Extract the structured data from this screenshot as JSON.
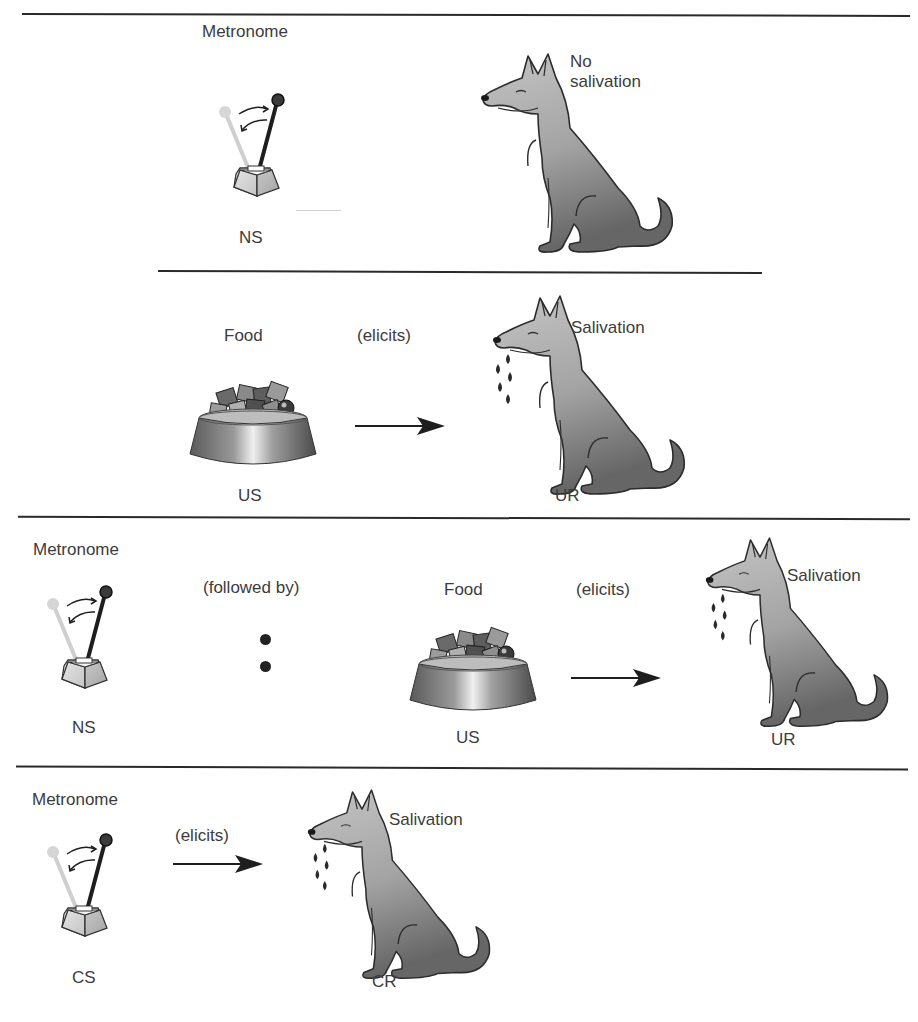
{
  "diagram": {
    "panels": [
      {
        "id": "before-conditioning-ns",
        "stimulus": {
          "name": "Metronome",
          "code": "NS"
        },
        "response": {
          "name": "No salivation"
        },
        "response_lines": [
          "No",
          "salivation"
        ]
      },
      {
        "id": "before-conditioning-us",
        "stimulus": {
          "name": "Food",
          "code": "US"
        },
        "relation": "(elicits)",
        "response": {
          "name": "Salivation",
          "code": "UR"
        }
      },
      {
        "id": "during-conditioning",
        "stimulus": {
          "name": "Metronome",
          "code": "NS"
        },
        "relation_1": "(followed by)",
        "stimulus_2": {
          "name": "Food",
          "code": "US"
        },
        "relation_2": "(elicits)",
        "response": {
          "name": "Salivation",
          "code": "UR"
        }
      },
      {
        "id": "after-conditioning",
        "stimulus": {
          "name": "Metronome",
          "code": "CS"
        },
        "relation": "(elicits)",
        "response": {
          "name": "Salivation",
          "code": "CR"
        }
      }
    ],
    "icons": [
      "metronome-icon",
      "dog-icon",
      "food-bowl-icon",
      "arrow-right-icon",
      "saliva-drops-icon",
      "colon-dots-icon"
    ],
    "colors": {
      "line": "#2a2a2a",
      "text": "#3c3c3c",
      "dog_light": "#b5b5b5",
      "dog_dark": "#6e6e6e",
      "metronome_base": "#cfcfcf"
    }
  }
}
